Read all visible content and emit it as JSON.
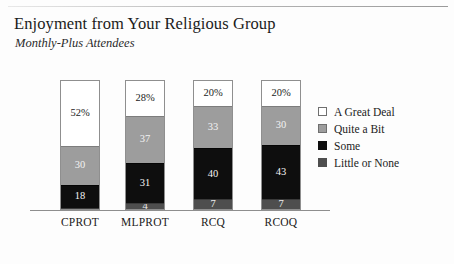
{
  "header": {
    "title": "Enjoyment from Your Religious Group",
    "subtitle": "Monthly-Plus Attendees"
  },
  "chart_data": {
    "type": "bar",
    "stacked": true,
    "stack_mode": "percent",
    "title": "Enjoyment from Your Religious Group",
    "subtitle": "Monthly-Plus Attendees",
    "xlabel": "",
    "ylabel": "",
    "ylim": [
      0,
      100
    ],
    "grid": false,
    "legend_position": "right",
    "categories": [
      "CPROT",
      "MLPROT",
      "RCQ",
      "RCOQ"
    ],
    "series": [
      {
        "name": "A Great Deal",
        "color": "#ffffff",
        "values": [
          52,
          28,
          20,
          20
        ],
        "labels": [
          "52%",
          "28%",
          "20%",
          "20%"
        ]
      },
      {
        "name": "Quite a Bit",
        "color": "#9d9d9d",
        "values": [
          30,
          37,
          33,
          30
        ],
        "labels": [
          "30",
          "37",
          "33",
          "30"
        ]
      },
      {
        "name": "Some",
        "color": "#0e0e0e",
        "values": [
          18,
          31,
          40,
          43
        ],
        "labels": [
          "18",
          "31",
          "40",
          "43"
        ]
      },
      {
        "name": "Little or None",
        "color": "#4e4e4e",
        "values": [
          0,
          4,
          7,
          7
        ],
        "labels": [
          "",
          "4",
          "7",
          "7"
        ]
      }
    ]
  }
}
